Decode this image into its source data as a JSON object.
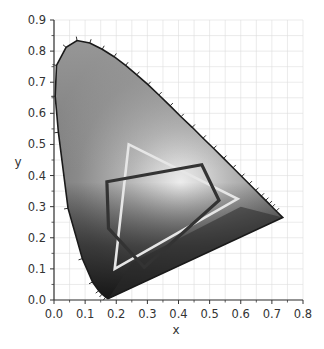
{
  "chart_data": {
    "type": "scatter",
    "title": "",
    "subtitle": "",
    "xlabel": "x",
    "ylabel": "y",
    "xlim": [
      0.0,
      0.8
    ],
    "ylim": [
      0.0,
      0.9
    ],
    "x_ticks": [
      "0.0",
      "0.1",
      "0.2",
      "0.3",
      "0.4",
      "0.5",
      "0.6",
      "0.7",
      "0.8"
    ],
    "y_ticks": [
      "0.0",
      "0.1",
      "0.2",
      "0.3",
      "0.4",
      "0.5",
      "0.6",
      "0.7",
      "0.8",
      "0.9"
    ],
    "grid": true,
    "legend": null,
    "spectral_locus": {
      "x": [
        0.175,
        0.172,
        0.166,
        0.155,
        0.144,
        0.124,
        0.091,
        0.045,
        0.014,
        0.004,
        0.008,
        0.039,
        0.074,
        0.115,
        0.155,
        0.193,
        0.23,
        0.266,
        0.302,
        0.337,
        0.373,
        0.408,
        0.444,
        0.479,
        0.513,
        0.545,
        0.575,
        0.603,
        0.627,
        0.648,
        0.666,
        0.68,
        0.691,
        0.701,
        0.714,
        0.735
      ],
      "y": [
        0.005,
        0.005,
        0.009,
        0.019,
        0.03,
        0.058,
        0.133,
        0.295,
        0.539,
        0.655,
        0.754,
        0.812,
        0.834,
        0.826,
        0.806,
        0.782,
        0.754,
        0.724,
        0.692,
        0.659,
        0.624,
        0.589,
        0.555,
        0.52,
        0.487,
        0.455,
        0.425,
        0.397,
        0.373,
        0.352,
        0.334,
        0.32,
        0.309,
        0.299,
        0.286,
        0.265
      ]
    },
    "series": [
      {
        "name": "light-triangle-gamut",
        "color": "#e6e6e6",
        "x": [
          0.24,
          0.59,
          0.195
        ],
        "y": [
          0.5,
          0.325,
          0.1
        ]
      },
      {
        "name": "dark-pentagon-gamut",
        "color": "#333333",
        "x": [
          0.17,
          0.475,
          0.53,
          0.29,
          0.175
        ],
        "y": [
          0.38,
          0.435,
          0.32,
          0.105,
          0.23
        ]
      }
    ]
  },
  "colors": {
    "locus_outline": "#1a1a1a",
    "axis": "#333333",
    "grid": "#dddddd"
  }
}
